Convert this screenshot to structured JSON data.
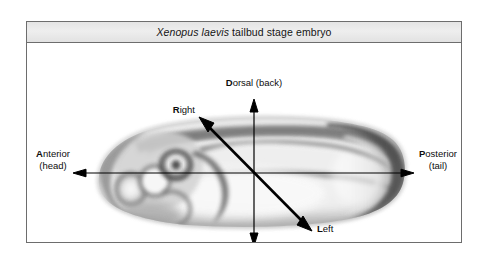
{
  "figure": {
    "title_species": "Xenopus laevis",
    "title_rest": " tailbud stage embryo",
    "title_full": "Xenopus laevis tailbud stage embryo",
    "background_color": "#ffffff",
    "frame_color": "#6d6d6d",
    "title_bar_color": "#e8e8e8"
  },
  "axes": {
    "anterior": {
      "primary": "A",
      "primary_rest": "nterior",
      "secondary": "(head)",
      "direction": "left"
    },
    "posterior": {
      "primary": "P",
      "primary_rest": "osterior",
      "secondary": "(tail)",
      "direction": "right"
    },
    "dorsal": {
      "primary": "D",
      "primary_rest": "orsal (back)",
      "secondary": "",
      "direction": "up"
    },
    "ventral": {
      "primary": "V",
      "primary_rest": "entral (front)",
      "secondary": "",
      "direction": "down"
    },
    "right": {
      "primary": "R",
      "primary_rest": "ight",
      "secondary": "",
      "direction": "upper-left"
    },
    "left": {
      "primary": "L",
      "primary_rest": "eft",
      "secondary": "",
      "direction": "lower-right"
    }
  },
  "specimen": {
    "name": "tailbud-stage-embryo",
    "description": "Lateral view grayscale photomicrograph of a Xenopus laevis tailbud stage embryo"
  }
}
